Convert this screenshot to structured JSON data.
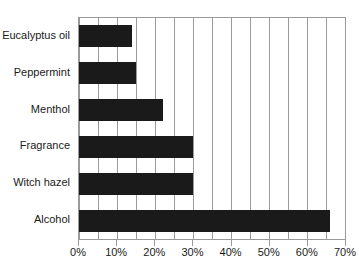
{
  "chart_data": {
    "type": "bar",
    "orientation": "horizontal",
    "title": "",
    "xlabel": "",
    "ylabel": "",
    "categories": [
      "Eucalyptus oil",
      "Peppermint",
      "Menthol",
      "Fragrance",
      "Witch hazel",
      "Alcohol"
    ],
    "values": [
      14,
      15,
      22,
      30,
      30,
      66
    ],
    "xlim": [
      0,
      70
    ],
    "xticks": [
      0,
      10,
      20,
      30,
      40,
      50,
      60,
      70
    ],
    "xtick_labels": [
      "0%",
      "10%",
      "20%",
      "30%",
      "40%",
      "50%",
      "60%",
      "70%"
    ],
    "gridline_interval": 5,
    "grid": true,
    "legend": false,
    "bar_color": "#1a1a1a",
    "grid_color": "#9a9a9a",
    "axis_color": "#9a9a9a",
    "background": "#ffffff"
  }
}
